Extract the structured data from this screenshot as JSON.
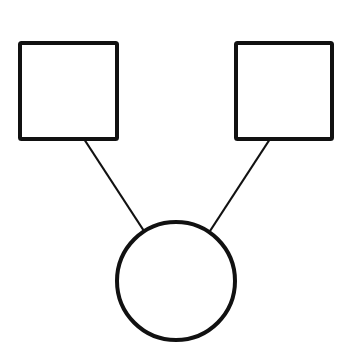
{
  "diagram": {
    "type": "pedigree",
    "stroke_color": "#111111",
    "background": "#ffffff",
    "nodes": [
      {
        "id": "left-square",
        "shape": "square",
        "x": 20,
        "y": 43,
        "w": 97,
        "h": 96
      },
      {
        "id": "right-square",
        "shape": "square",
        "x": 236,
        "y": 43,
        "w": 96,
        "h": 96
      },
      {
        "id": "circle",
        "shape": "circle",
        "cx": 176,
        "cy": 281,
        "r": 59
      }
    ],
    "edges": [
      {
        "from": "left-square",
        "to": "circle",
        "x1": 84,
        "y1": 139,
        "x2": 144,
        "y2": 231
      },
      {
        "from": "right-square",
        "to": "circle",
        "x1": 270,
        "y1": 139,
        "x2": 210,
        "y2": 231
      }
    ]
  }
}
